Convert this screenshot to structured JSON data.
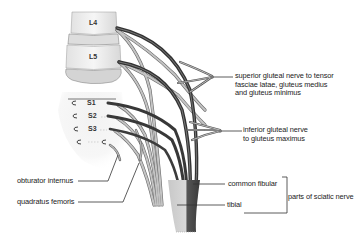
{
  "diagram": {
    "type": "anatomical-illustration",
    "vertebrae": [
      "L4",
      "L5",
      "S1",
      "S2",
      "S3"
    ],
    "labels": {
      "superior_gluteal": [
        "superior gluteal nerve to tensor",
        "fasciae latae, gluteus medius",
        "and gluteus minimus"
      ],
      "inferior_gluteal": [
        "inferior gluteal nerve",
        "to gluteus maximus"
      ],
      "obturator_internus": "obturator internus",
      "quadratus_femoris": "quadratus femoris",
      "common_fibular": "common fibular",
      "tibial": "tibial",
      "sciatic_group": "parts of sciatic nerve"
    },
    "colors": {
      "dark_nerve": "#3a3a3a",
      "light_nerve": "#b8b8b8",
      "bone": "#eeeeee",
      "bone_shade": "#cfcfcf",
      "leader_line": "#333333"
    }
  }
}
